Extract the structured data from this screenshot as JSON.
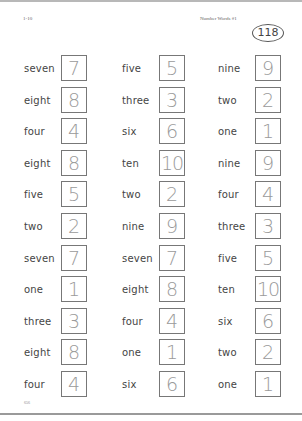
{
  "header": {
    "range": "1-10",
    "title": "Number Words #1",
    "page_badge": "118"
  },
  "footer": {
    "code": "656"
  },
  "columns": [
    {
      "items": [
        {
          "word": "seven",
          "number": "7"
        },
        {
          "word": "eight",
          "number": "8"
        },
        {
          "word": "four",
          "number": "4"
        },
        {
          "word": "eight",
          "number": "8"
        },
        {
          "word": "five",
          "number": "5"
        },
        {
          "word": "two",
          "number": "2"
        },
        {
          "word": "seven",
          "number": "7"
        },
        {
          "word": "one",
          "number": "1"
        },
        {
          "word": "three",
          "number": "3"
        },
        {
          "word": "eight",
          "number": "8"
        },
        {
          "word": "four",
          "number": "4"
        }
      ]
    },
    {
      "items": [
        {
          "word": "five",
          "number": "5"
        },
        {
          "word": "three",
          "number": "3"
        },
        {
          "word": "six",
          "number": "6"
        },
        {
          "word": "ten",
          "number": "10"
        },
        {
          "word": "two",
          "number": "2"
        },
        {
          "word": "nine",
          "number": "9"
        },
        {
          "word": "seven",
          "number": "7"
        },
        {
          "word": "eight",
          "number": "8"
        },
        {
          "word": "four",
          "number": "4"
        },
        {
          "word": "one",
          "number": "1"
        },
        {
          "word": "six",
          "number": "6"
        }
      ]
    },
    {
      "items": [
        {
          "word": "nine",
          "number": "9"
        },
        {
          "word": "two",
          "number": "2"
        },
        {
          "word": "one",
          "number": "1"
        },
        {
          "word": "nine",
          "number": "9"
        },
        {
          "word": "four",
          "number": "4"
        },
        {
          "word": "three",
          "number": "3"
        },
        {
          "word": "five",
          "number": "5"
        },
        {
          "word": "ten",
          "number": "10"
        },
        {
          "word": "six",
          "number": "6"
        },
        {
          "word": "two",
          "number": "2"
        },
        {
          "word": "one",
          "number": "1"
        }
      ]
    }
  ]
}
